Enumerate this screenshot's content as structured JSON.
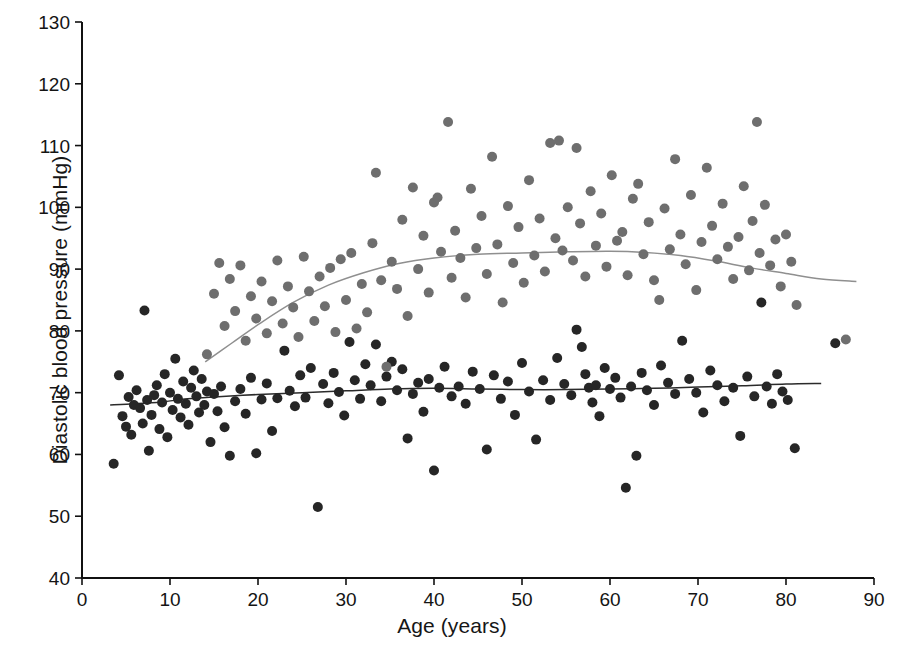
{
  "chart_data": {
    "type": "scatter",
    "title": "",
    "xlabel": "Age (years)",
    "ylabel": "Diastolic blood pressure (mmHg)",
    "xlim": [
      0,
      90
    ],
    "ylim": [
      40,
      130
    ],
    "xticks": [
      0,
      10,
      20,
      30,
      40,
      50,
      60,
      70,
      80,
      90
    ],
    "yticks": [
      40,
      50,
      60,
      70,
      80,
      90,
      100,
      110,
      120,
      130
    ],
    "xtick_labels": [
      "0",
      "10",
      "20",
      "30",
      "40",
      "50",
      "60",
      "70",
      "80",
      "90"
    ],
    "ytick_labels": [
      "40",
      "50",
      "60",
      "70",
      "80",
      "90",
      "100",
      "110",
      "120",
      "130"
    ],
    "grid": false,
    "legend": "none",
    "series": [
      {
        "name": "group-dark",
        "color": "#262626",
        "marker": "circle",
        "marker_size": 9,
        "points": [
          [
            3.6,
            58.5
          ],
          [
            4.2,
            72.8
          ],
          [
            4.6,
            66.2
          ],
          [
            5.0,
            64.5
          ],
          [
            5.3,
            69.3
          ],
          [
            5.6,
            63.2
          ],
          [
            5.9,
            68.0
          ],
          [
            6.2,
            70.4
          ],
          [
            6.6,
            67.5
          ],
          [
            6.9,
            65.0
          ],
          [
            7.1,
            83.3
          ],
          [
            7.4,
            68.8
          ],
          [
            7.6,
            60.6
          ],
          [
            7.9,
            66.4
          ],
          [
            8.2,
            69.6
          ],
          [
            8.5,
            71.2
          ],
          [
            8.8,
            64.1
          ],
          [
            9.1,
            68.4
          ],
          [
            9.4,
            73.0
          ],
          [
            9.7,
            62.8
          ],
          [
            10.0,
            70.0
          ],
          [
            10.3,
            67.2
          ],
          [
            10.6,
            75.5
          ],
          [
            10.9,
            69.0
          ],
          [
            11.2,
            66.0
          ],
          [
            11.5,
            71.8
          ],
          [
            11.8,
            68.2
          ],
          [
            12.1,
            64.8
          ],
          [
            12.4,
            70.8
          ],
          [
            12.7,
            73.6
          ],
          [
            13.0,
            69.4
          ],
          [
            13.3,
            66.8
          ],
          [
            13.6,
            72.2
          ],
          [
            13.9,
            68.0
          ],
          [
            14.2,
            70.2
          ],
          [
            14.6,
            62.0
          ],
          [
            15.0,
            69.8
          ],
          [
            15.4,
            67.0
          ],
          [
            15.8,
            71.0
          ],
          [
            16.2,
            64.4
          ],
          [
            16.8,
            59.8
          ],
          [
            17.4,
            68.6
          ],
          [
            18.0,
            70.6
          ],
          [
            18.6,
            66.6
          ],
          [
            19.2,
            72.4
          ],
          [
            19.8,
            60.2
          ],
          [
            20.4,
            68.9
          ],
          [
            21.0,
            71.5
          ],
          [
            21.6,
            63.8
          ],
          [
            22.2,
            69.1
          ],
          [
            23.0,
            76.8
          ],
          [
            23.6,
            70.3
          ],
          [
            24.2,
            67.8
          ],
          [
            24.8,
            72.8
          ],
          [
            25.4,
            69.2
          ],
          [
            26.0,
            74.0
          ],
          [
            26.8,
            51.5
          ],
          [
            27.4,
            71.4
          ],
          [
            28.0,
            68.3
          ],
          [
            28.6,
            73.2
          ],
          [
            29.2,
            70.1
          ],
          [
            29.8,
            66.3
          ],
          [
            30.4,
            78.2
          ],
          [
            31.0,
            72.0
          ],
          [
            31.6,
            69.0
          ],
          [
            32.2,
            74.6
          ],
          [
            32.8,
            71.2
          ],
          [
            33.4,
            77.8
          ],
          [
            34.0,
            68.6
          ],
          [
            34.6,
            72.6
          ],
          [
            35.2,
            75.0
          ],
          [
            35.8,
            70.4
          ],
          [
            36.4,
            73.8
          ],
          [
            37.0,
            62.6
          ],
          [
            37.6,
            69.8
          ],
          [
            38.2,
            71.6
          ],
          [
            38.8,
            66.9
          ],
          [
            39.4,
            72.2
          ],
          [
            40.0,
            57.4
          ],
          [
            40.6,
            70.8
          ],
          [
            41.2,
            74.2
          ],
          [
            42.0,
            69.4
          ],
          [
            42.8,
            71.0
          ],
          [
            43.6,
            68.2
          ],
          [
            44.4,
            73.4
          ],
          [
            45.2,
            70.6
          ],
          [
            46.0,
            60.8
          ],
          [
            46.8,
            72.8
          ],
          [
            47.6,
            69.0
          ],
          [
            48.4,
            71.8
          ],
          [
            49.2,
            66.4
          ],
          [
            50.0,
            74.8
          ],
          [
            50.8,
            70.2
          ],
          [
            51.6,
            62.4
          ],
          [
            52.4,
            72.0
          ],
          [
            53.2,
            68.8
          ],
          [
            54.0,
            75.6
          ],
          [
            54.8,
            71.4
          ],
          [
            55.6,
            69.6
          ],
          [
            56.2,
            80.2
          ],
          [
            56.8,
            77.4
          ],
          [
            57.2,
            73.0
          ],
          [
            57.6,
            70.8
          ],
          [
            58.0,
            68.4
          ],
          [
            58.4,
            71.2
          ],
          [
            58.8,
            66.2
          ],
          [
            59.4,
            74.0
          ],
          [
            60.0,
            70.6
          ],
          [
            60.6,
            72.4
          ],
          [
            61.2,
            69.2
          ],
          [
            61.8,
            54.6
          ],
          [
            62.4,
            71.0
          ],
          [
            63.0,
            59.8
          ],
          [
            63.6,
            73.2
          ],
          [
            64.2,
            70.4
          ],
          [
            65.0,
            68.0
          ],
          [
            65.8,
            74.4
          ],
          [
            66.6,
            71.6
          ],
          [
            67.4,
            69.8
          ],
          [
            68.2,
            78.4
          ],
          [
            69.0,
            72.2
          ],
          [
            69.8,
            70.0
          ],
          [
            70.6,
            66.8
          ],
          [
            71.4,
            73.6
          ],
          [
            72.2,
            71.2
          ],
          [
            73.0,
            68.6
          ],
          [
            74.0,
            70.8
          ],
          [
            74.8,
            63.0
          ],
          [
            75.6,
            72.6
          ],
          [
            76.4,
            69.4
          ],
          [
            77.2,
            84.6
          ],
          [
            77.8,
            71.0
          ],
          [
            78.4,
            68.2
          ],
          [
            79.0,
            73.0
          ],
          [
            79.6,
            70.2
          ],
          [
            80.2,
            68.8
          ],
          [
            81.0,
            61.0
          ],
          [
            85.6,
            78.0
          ]
        ]
      },
      {
        "name": "group-gray",
        "color": "#6e6e6e",
        "marker": "circle",
        "marker_size": 9,
        "points": [
          [
            14.2,
            76.2
          ],
          [
            15.0,
            86.0
          ],
          [
            15.6,
            91.0
          ],
          [
            16.2,
            80.8
          ],
          [
            16.8,
            88.4
          ],
          [
            17.4,
            83.2
          ],
          [
            18.0,
            90.6
          ],
          [
            18.6,
            78.4
          ],
          [
            19.2,
            85.6
          ],
          [
            19.8,
            82.0
          ],
          [
            20.4,
            88.0
          ],
          [
            21.0,
            79.6
          ],
          [
            21.6,
            84.8
          ],
          [
            22.2,
            91.4
          ],
          [
            22.8,
            81.2
          ],
          [
            23.4,
            87.2
          ],
          [
            24.0,
            83.8
          ],
          [
            24.6,
            79.0
          ],
          [
            25.2,
            92.0
          ],
          [
            25.8,
            86.4
          ],
          [
            26.4,
            81.6
          ],
          [
            27.0,
            88.8
          ],
          [
            27.6,
            84.0
          ],
          [
            28.2,
            90.2
          ],
          [
            28.8,
            79.8
          ],
          [
            29.4,
            91.6
          ],
          [
            30.0,
            85.0
          ],
          [
            30.6,
            92.6
          ],
          [
            31.2,
            80.4
          ],
          [
            31.8,
            87.6
          ],
          [
            32.4,
            83.0
          ],
          [
            33.0,
            94.2
          ],
          [
            33.4,
            105.6
          ],
          [
            34.0,
            88.2
          ],
          [
            34.6,
            74.2
          ],
          [
            35.2,
            91.2
          ],
          [
            35.8,
            86.8
          ],
          [
            36.4,
            98.0
          ],
          [
            37.0,
            82.4
          ],
          [
            37.6,
            103.2
          ],
          [
            38.2,
            90.0
          ],
          [
            38.8,
            95.4
          ],
          [
            39.4,
            86.2
          ],
          [
            40.0,
            100.8
          ],
          [
            40.4,
            101.6
          ],
          [
            40.8,
            92.8
          ],
          [
            41.6,
            113.8
          ],
          [
            42.0,
            88.6
          ],
          [
            42.4,
            96.2
          ],
          [
            43.0,
            91.8
          ],
          [
            43.6,
            85.4
          ],
          [
            44.2,
            103.0
          ],
          [
            44.8,
            93.4
          ],
          [
            45.4,
            98.6
          ],
          [
            46.0,
            89.2
          ],
          [
            46.6,
            108.2
          ],
          [
            47.2,
            94.0
          ],
          [
            47.8,
            84.6
          ],
          [
            48.4,
            100.2
          ],
          [
            49.0,
            91.0
          ],
          [
            49.6,
            96.8
          ],
          [
            50.2,
            87.8
          ],
          [
            50.8,
            104.4
          ],
          [
            51.4,
            92.2
          ],
          [
            52.0,
            98.2
          ],
          [
            52.6,
            89.6
          ],
          [
            53.2,
            110.4
          ],
          [
            53.8,
            95.0
          ],
          [
            54.2,
            110.8
          ],
          [
            54.6,
            93.0
          ],
          [
            55.2,
            100.0
          ],
          [
            55.8,
            91.4
          ],
          [
            56.2,
            109.6
          ],
          [
            56.6,
            97.4
          ],
          [
            57.2,
            88.8
          ],
          [
            57.8,
            102.6
          ],
          [
            58.4,
            93.8
          ],
          [
            59.0,
            99.0
          ],
          [
            59.6,
            90.4
          ],
          [
            60.2,
            105.2
          ],
          [
            60.8,
            94.6
          ],
          [
            61.4,
            96.0
          ],
          [
            62.0,
            89.0
          ],
          [
            62.6,
            101.4
          ],
          [
            63.2,
            103.8
          ],
          [
            63.8,
            92.4
          ],
          [
            64.4,
            97.6
          ],
          [
            65.0,
            88.2
          ],
          [
            65.6,
            85.0
          ],
          [
            66.2,
            99.8
          ],
          [
            66.8,
            93.2
          ],
          [
            67.4,
            107.8
          ],
          [
            68.0,
            95.6
          ],
          [
            68.6,
            90.8
          ],
          [
            69.2,
            102.0
          ],
          [
            69.8,
            86.6
          ],
          [
            70.4,
            94.4
          ],
          [
            71.0,
            106.4
          ],
          [
            71.6,
            97.0
          ],
          [
            72.2,
            91.6
          ],
          [
            72.8,
            100.6
          ],
          [
            73.4,
            93.6
          ],
          [
            74.0,
            88.4
          ],
          [
            74.6,
            95.2
          ],
          [
            75.2,
            103.4
          ],
          [
            75.8,
            89.8
          ],
          [
            76.2,
            97.8
          ],
          [
            76.7,
            113.8
          ],
          [
            77.0,
            92.6
          ],
          [
            77.6,
            100.4
          ],
          [
            78.2,
            90.6
          ],
          [
            78.8,
            94.8
          ],
          [
            79.4,
            87.2
          ],
          [
            80.0,
            95.6
          ],
          [
            80.6,
            91.2
          ],
          [
            81.2,
            84.2
          ],
          [
            86.8,
            78.6
          ]
        ]
      }
    ],
    "trend_lines": [
      {
        "name": "dark-trend",
        "color": "#2b2b2b",
        "points": [
          [
            3.2,
            68.0
          ],
          [
            6.0,
            68.2
          ],
          [
            9.0,
            68.5
          ],
          [
            12.0,
            69.0
          ],
          [
            15.0,
            69.3
          ],
          [
            20.0,
            69.7
          ],
          [
            25.0,
            70.0
          ],
          [
            30.0,
            70.3
          ],
          [
            35.0,
            70.6
          ],
          [
            40.0,
            70.7
          ],
          [
            45.0,
            70.6
          ],
          [
            50.0,
            70.5
          ],
          [
            55.0,
            70.5
          ],
          [
            60.0,
            70.6
          ],
          [
            65.0,
            70.7
          ],
          [
            70.0,
            70.9
          ],
          [
            75.0,
            71.1
          ],
          [
            80.0,
            71.4
          ],
          [
            84.0,
            71.5
          ]
        ]
      },
      {
        "name": "gray-trend",
        "color": "#8f8f8f",
        "points": [
          [
            14.0,
            75.0
          ],
          [
            17.0,
            78.0
          ],
          [
            20.0,
            81.0
          ],
          [
            24.0,
            84.6
          ],
          [
            28.0,
            87.4
          ],
          [
            32.0,
            89.4
          ],
          [
            36.0,
            90.9
          ],
          [
            40.0,
            91.8
          ],
          [
            45.0,
            92.4
          ],
          [
            50.0,
            92.6
          ],
          [
            55.0,
            92.8
          ],
          [
            60.0,
            92.9
          ],
          [
            64.0,
            92.7
          ],
          [
            68.0,
            92.2
          ],
          [
            72.0,
            91.3
          ],
          [
            76.0,
            90.2
          ],
          [
            80.0,
            89.3
          ],
          [
            84.0,
            88.4
          ],
          [
            88.0,
            88.0
          ]
        ]
      }
    ]
  },
  "axes": {
    "x_title": "Age (years)",
    "y_title": "Diastolic blood pressure (mmHg)"
  }
}
